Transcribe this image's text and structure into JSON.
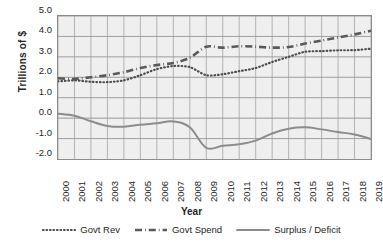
{
  "chart_data": {
    "type": "line",
    "title": "",
    "xlabel": "Year",
    "ylabel": "Trillions of $",
    "xlim": [
      2000,
      2019
    ],
    "ylim": [
      -2.0,
      5.0
    ],
    "grid": true,
    "legend_position": "bottom",
    "y_ticks": [
      "5.0",
      "4.0",
      "3.0",
      "2.0",
      "1.0",
      "0.0",
      "-1.0",
      "-2.0"
    ],
    "y_tick_values": [
      5.0,
      4.0,
      3.0,
      2.0,
      1.0,
      0.0,
      -1.0,
      -2.0
    ],
    "categories": [
      "2000",
      "2001",
      "2002",
      "2003",
      "2004",
      "2005",
      "2006",
      "2007",
      "2008",
      "2009",
      "2010",
      "2011",
      "2012",
      "2013",
      "2014",
      "2015",
      "2016",
      "2017",
      "2018",
      "2019"
    ],
    "x": [
      2000,
      2001,
      2002,
      2003,
      2004,
      2005,
      2006,
      2007,
      2008,
      2009,
      2010,
      2011,
      2012,
      2013,
      2014,
      2015,
      2016,
      2017,
      2018,
      2019
    ],
    "series": [
      {
        "name": "Govt Rev",
        "style": "dotted",
        "color": "#4d4d4d",
        "values": [
          1.8,
          1.85,
          1.78,
          1.76,
          1.85,
          2.1,
          2.4,
          2.55,
          2.5,
          2.1,
          2.15,
          2.3,
          2.45,
          2.75,
          3.0,
          3.25,
          3.28,
          3.32,
          3.33,
          3.4
        ]
      },
      {
        "name": "Govt Spend",
        "style": "dash-dot",
        "color": "#595959",
        "values": [
          1.95,
          1.92,
          2.0,
          2.1,
          2.25,
          2.45,
          2.6,
          2.7,
          2.95,
          3.5,
          3.45,
          3.52,
          3.5,
          3.45,
          3.48,
          3.65,
          3.8,
          3.95,
          4.1,
          4.28
        ]
      },
      {
        "name": "Surplus / Deficit",
        "style": "solid",
        "color": "#8c8c8c",
        "values": [
          0.22,
          0.12,
          -0.15,
          -0.38,
          -0.42,
          -0.32,
          -0.25,
          -0.16,
          -0.45,
          -1.45,
          -1.35,
          -1.28,
          -1.1,
          -0.75,
          -0.52,
          -0.45,
          -0.55,
          -0.68,
          -0.8,
          -1.02
        ]
      }
    ]
  },
  "axis": {
    "y_title": "Trillions of $",
    "x_title": "Year"
  },
  "legend": {
    "entries": [
      {
        "label": "Govt Rev"
      },
      {
        "label": "Govt Spend"
      },
      {
        "label": "Surplus / Deficit"
      }
    ]
  }
}
